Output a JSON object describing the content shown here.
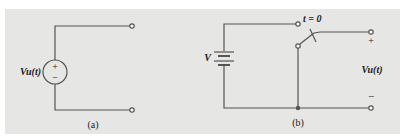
{
  "figure": {
    "background_color": "#e6e6e4",
    "wire_color": "#555555",
    "panels": [
      {
        "id": "a",
        "caption": "(a)",
        "source_label": "Vu(t)",
        "source_type": "independent voltage source",
        "source_polarity": {
          "top": "+",
          "bottom": "−"
        }
      },
      {
        "id": "b",
        "caption": "(b)",
        "battery_label": "V",
        "switch_label": "t = 0",
        "output_label": "Vu(t)",
        "output_polarity": {
          "top": "+",
          "bottom": "−"
        }
      }
    ]
  }
}
